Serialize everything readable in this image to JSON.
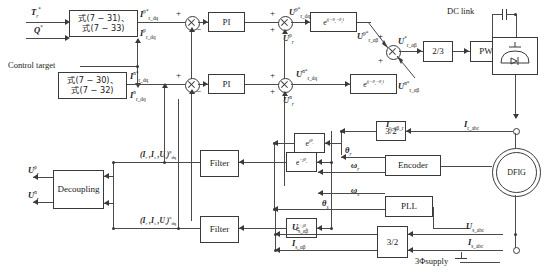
{
  "diagram": {
    "inputs": {
      "torque_ref": "T*_r",
      "reactive_ref": "Q*",
      "control_target": "Control target"
    },
    "blocks": {
      "eq_pos": "式(7-31)、\n式(7-33)",
      "eq_pos_line1": "式(7 − 31)、",
      "eq_pos_line2": "式(7 − 33)",
      "eq_neg_line1": "式(7 − 30)、",
      "eq_neg_line2": "式(7 − 32)",
      "pi_pos": "PI",
      "pi_neg": "PI",
      "rot_pos": "e j(−θs−θr)",
      "rot_neg": "e j(−θs−θr)",
      "two_three": "2/3",
      "pwm": "PWM",
      "decoupling": "Decoupling",
      "filter_pos": "Filter",
      "filter_neg": "Filter",
      "exp_neg_js": "e −jθs",
      "exp_pos_js": "e +jθs",
      "exp_jr": "e jθr",
      "three_two_rotor": "3/2",
      "three_two_stator": "3/2",
      "encoder": "Encoder",
      "pll": "PLL",
      "dfig": "DFIG"
    },
    "labels": {
      "dc_link": "DC link",
      "supply": "3Φsupply",
      "ir_dq_p_ref": "I p*r_dq",
      "ir_dq_p_fb": "I pr_dq",
      "ir_dq_n_ref": "I n*r_dq",
      "ir_dq_n_fb": "I nr_dq",
      "ur_dq_p_ref": "U p*r_dq",
      "ur_dq_n_ref": "U n*r_dq",
      "ur_p": "U pr",
      "ur_n": "U nr",
      "ur_ab_p_ref": "U p*r_αβ",
      "ur_ab_n_ref": "U n*r_αβ",
      "ur_ab_ref": "U *r_αβ",
      "filter_sig_p": "(I r , I s , U s) pdq",
      "filter_sig_n": "(I r , I s , U s) ndq",
      "ir_ab_r": "I r_αβ_r",
      "ir_abc": "I r_abc",
      "us_ab": "U s_αβ",
      "is_ab": "I s_αβ",
      "us_abc": "U s_abc",
      "is_abc": "I s_abc",
      "theta_r": "θr",
      "omega_r": "ωr",
      "theta_s": "θs",
      "omega_s": "ωs"
    },
    "signs": {
      "plus": "+",
      "minus": "−"
    },
    "colors": {
      "line": "#4a4a4a",
      "block_border": "#3a3a3a",
      "background": "#ffffff"
    }
  }
}
